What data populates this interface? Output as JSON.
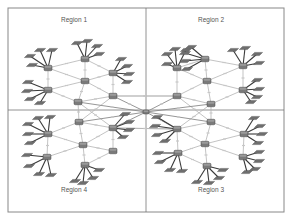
{
  "diagram": {
    "regions": [
      {
        "id": "r1",
        "label": "Region 1",
        "label_x": 56,
        "label_y": 22
      },
      {
        "id": "r2",
        "label": "Region 2",
        "label_x": 193,
        "label_y": 22
      },
      {
        "id": "r4",
        "label": "Region 4",
        "label_x": 56,
        "label_y": 192
      },
      {
        "id": "r3",
        "label": "Region 3",
        "label_x": 193,
        "label_y": 192
      }
    ],
    "frame": {
      "x": 8,
      "y": 8,
      "width": 276,
      "height": 204
    },
    "dividers": {
      "vertical_x": 146,
      "horizontal_y": 110
    },
    "colors": {
      "router": "#7a7a7a",
      "host": "#6e6e6e",
      "spoke": "#3a3a3a",
      "link": "#b4b4b4",
      "frame": "#888888"
    },
    "routers": [
      {
        "id": "c0",
        "region": "core",
        "x": 146,
        "y": 112,
        "size": "small"
      },
      {
        "id": "r1a",
        "region": "r1",
        "x": 48,
        "y": 68
      },
      {
        "id": "r1b",
        "region": "r1",
        "x": 85,
        "y": 59
      },
      {
        "id": "r1c",
        "region": "r1",
        "x": 113,
        "y": 73
      },
      {
        "id": "r1d",
        "region": "r1",
        "x": 85,
        "y": 81
      },
      {
        "id": "r1e",
        "region": "r1",
        "x": 48,
        "y": 90
      },
      {
        "id": "r1f",
        "region": "r1",
        "x": 78,
        "y": 102
      },
      {
        "id": "r1g",
        "region": "r1",
        "x": 113,
        "y": 96
      },
      {
        "id": "r2a",
        "region": "r2",
        "x": 177,
        "y": 68
      },
      {
        "id": "r2b",
        "region": "r2",
        "x": 205,
        "y": 59
      },
      {
        "id": "r2c",
        "region": "r2",
        "x": 243,
        "y": 66
      },
      {
        "id": "r2d",
        "region": "r2",
        "x": 207,
        "y": 81
      },
      {
        "id": "r2e",
        "region": "r2",
        "x": 177,
        "y": 96
      },
      {
        "id": "r2f",
        "region": "r2",
        "x": 211,
        "y": 104
      },
      {
        "id": "r2g",
        "region": "r2",
        "x": 243,
        "y": 90
      },
      {
        "id": "r4a",
        "region": "r4",
        "x": 48,
        "y": 134
      },
      {
        "id": "r4b",
        "region": "r4",
        "x": 79,
        "y": 122
      },
      {
        "id": "r4c",
        "region": "r4",
        "x": 113,
        "y": 128
      },
      {
        "id": "r4d",
        "region": "r4",
        "x": 83,
        "y": 145
      },
      {
        "id": "r4e",
        "region": "r4",
        "x": 47,
        "y": 157
      },
      {
        "id": "r4f",
        "region": "r4",
        "x": 85,
        "y": 165
      },
      {
        "id": "r4g",
        "region": "r4",
        "x": 113,
        "y": 151
      },
      {
        "id": "r3a",
        "region": "r3",
        "x": 177,
        "y": 129
      },
      {
        "id": "r3b",
        "region": "r3",
        "x": 211,
        "y": 122
      },
      {
        "id": "r3c",
        "region": "r3",
        "x": 244,
        "y": 134
      },
      {
        "id": "r3d",
        "region": "r3",
        "x": 205,
        "y": 144
      },
      {
        "id": "r3e",
        "region": "r3",
        "x": 178,
        "y": 153
      },
      {
        "id": "r3f",
        "region": "r3",
        "x": 207,
        "y": 166
      },
      {
        "id": "r3g",
        "region": "r3",
        "x": 243,
        "y": 157
      }
    ],
    "links": [
      [
        "r1a",
        "r1b"
      ],
      [
        "r1a",
        "r1d"
      ],
      [
        "r1a",
        "r1e"
      ],
      [
        "r1b",
        "r1d"
      ],
      [
        "r1b",
        "r1c"
      ],
      [
        "r1c",
        "r1d"
      ],
      [
        "r1d",
        "r1e"
      ],
      [
        "r1d",
        "r1f"
      ],
      [
        "r1d",
        "r1g"
      ],
      [
        "r1c",
        "r1g"
      ],
      [
        "r1e",
        "r1f"
      ],
      [
        "r1f",
        "r1g"
      ],
      [
        "r2a",
        "r2b"
      ],
      [
        "r2a",
        "r2d"
      ],
      [
        "r2a",
        "r2e"
      ],
      [
        "r2b",
        "r2d"
      ],
      [
        "r2b",
        "r2c"
      ],
      [
        "r2c",
        "r2d"
      ],
      [
        "r2c",
        "r2g"
      ],
      [
        "r2d",
        "r2e"
      ],
      [
        "r2d",
        "r2f"
      ],
      [
        "r2d",
        "r2g"
      ],
      [
        "r2e",
        "r2f"
      ],
      [
        "r2f",
        "r2g"
      ],
      [
        "r4a",
        "r4b"
      ],
      [
        "r4a",
        "r4d"
      ],
      [
        "r4a",
        "r4e"
      ],
      [
        "r4b",
        "r4c"
      ],
      [
        "r4b",
        "r4d"
      ],
      [
        "r4c",
        "r4d"
      ],
      [
        "r4c",
        "r4g"
      ],
      [
        "r4d",
        "r4e"
      ],
      [
        "r4d",
        "r4f"
      ],
      [
        "r4d",
        "r4g"
      ],
      [
        "r4f",
        "r4g"
      ],
      [
        "r3a",
        "r3b"
      ],
      [
        "r3a",
        "r3d"
      ],
      [
        "r3a",
        "r3e"
      ],
      [
        "r3b",
        "r3c"
      ],
      [
        "r3b",
        "r3d"
      ],
      [
        "r3c",
        "r3d"
      ],
      [
        "r3c",
        "r3g"
      ],
      [
        "r3d",
        "r3e"
      ],
      [
        "r3d",
        "r3f"
      ],
      [
        "r3d",
        "r3g"
      ],
      [
        "r3e",
        "r3f"
      ],
      [
        "r1g",
        "r2e"
      ],
      [
        "r1f",
        "r4b"
      ],
      [
        "r2f",
        "r3b"
      ],
      [
        "r4c",
        "r3a"
      ],
      [
        "r1g",
        "r4b"
      ],
      [
        "r1f",
        "r4c"
      ],
      [
        "r2e",
        "r3b"
      ],
      [
        "r2f",
        "r3a"
      ],
      [
        "r1g",
        "r2e"
      ],
      [
        "r4c",
        "r3a"
      ]
    ],
    "core_links": [
      [
        "c0",
        "r1g"
      ],
      [
        "c0",
        "r2e"
      ],
      [
        "c0",
        "r4c"
      ],
      [
        "c0",
        "r3a"
      ],
      [
        "c0",
        "r1f"
      ],
      [
        "c0",
        "r2f"
      ],
      [
        "c0",
        "r4b"
      ],
      [
        "c0",
        "r3b"
      ]
    ],
    "hosts": [
      {
        "router": "r1a",
        "dx": [
          -10,
          -16,
          -18,
          -15,
          -6,
          4
        ],
        " dy": []
      },
      {
        "router": "r1a",
        "offsets": [
          [
            -18,
            -12
          ],
          [
            -16,
            -3
          ],
          [
            -8,
            -18
          ],
          [
            4,
            -18
          ]
        ]
      },
      {
        "router": "r1b",
        "offsets": [
          [
            -8,
            -16
          ],
          [
            2,
            -18
          ],
          [
            12,
            -13
          ],
          [
            14,
            -5
          ]
        ]
      },
      {
        "router": "r1c",
        "offsets": [
          [
            8,
            -14
          ],
          [
            14,
            -7
          ],
          [
            16,
            1
          ],
          [
            14,
            9
          ]
        ]
      },
      {
        "router": "r1e",
        "offsets": [
          [
            -20,
            -8
          ],
          [
            -21,
            1
          ],
          [
            -18,
            9
          ],
          [
            -8,
            13
          ]
        ]
      },
      {
        "router": "r2a",
        "offsets": [
          [
            -10,
            -14
          ],
          [
            -2,
            -19
          ],
          [
            9,
            -18
          ],
          [
            -10,
            -4
          ]
        ]
      },
      {
        "router": "r2b",
        "offsets": [
          [
            -20,
            -6
          ],
          [
            -20,
            2
          ],
          [
            -18,
            10
          ],
          [
            -14,
            -12
          ]
        ]
      },
      {
        "router": "r2c",
        "offsets": [
          [
            -10,
            -16
          ],
          [
            2,
            -18
          ],
          [
            14,
            -12
          ],
          [
            16,
            -3
          ]
        ]
      },
      {
        "router": "r2g",
        "offsets": [
          [
            14,
            -10
          ],
          [
            16,
            -1
          ],
          [
            14,
            7
          ],
          [
            8,
            12
          ]
        ]
      },
      {
        "router": "r4a",
        "offsets": [
          [
            -20,
            -10
          ],
          [
            -20,
            0
          ],
          [
            -18,
            9
          ],
          [
            -10,
            -16
          ],
          [
            2,
            -17
          ]
        ]
      },
      {
        "router": "r4c",
        "offsets": [
          [
            12,
            -14
          ],
          [
            16,
            -6
          ],
          [
            16,
            2
          ],
          [
            10,
            9
          ]
        ]
      },
      {
        "router": "r4e",
        "offsets": [
          [
            -20,
            -2
          ],
          [
            -18,
            9
          ],
          [
            -8,
            17
          ],
          [
            4,
            18
          ]
        ]
      },
      {
        "router": "r4f",
        "offsets": [
          [
            -10,
            16
          ],
          [
            -2,
            18
          ],
          [
            8,
            13
          ],
          [
            14,
            5
          ]
        ]
      },
      {
        "router": "r3a",
        "offsets": [
          [
            -20,
            -12
          ],
          [
            -22,
            -3
          ],
          [
            -20,
            6
          ],
          [
            -12,
            12
          ]
        ]
      },
      {
        "router": "r3c",
        "offsets": [
          [
            10,
            -16
          ],
          [
            16,
            -8
          ],
          [
            18,
            0
          ],
          [
            14,
            9
          ]
        ]
      },
      {
        "router": "r3e",
        "offsets": [
          [
            -20,
            0
          ],
          [
            -18,
            9
          ],
          [
            -8,
            17
          ],
          [
            4,
            18
          ]
        ]
      },
      {
        "router": "r3f",
        "offsets": [
          [
            -10,
            16
          ],
          [
            2,
            17
          ],
          [
            12,
            12
          ],
          [
            16,
            4
          ]
        ]
      },
      {
        "router": "r3g",
        "offsets": [
          [
            16,
            -5
          ],
          [
            16,
            4
          ],
          [
            12,
            12
          ],
          [
            4,
            15
          ]
        ]
      }
    ]
  }
}
